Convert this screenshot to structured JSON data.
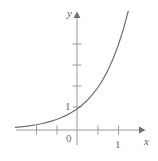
{
  "figure": {
    "kind": "cartesian-plot",
    "background_color": "#ffffff",
    "width": 158,
    "height": 161
  },
  "axes": {
    "x_axis": {
      "name": "x-axis",
      "label": "x",
      "arrow": true,
      "tick_labels": [
        "1"
      ],
      "origin_label": "0"
    },
    "y_axis": {
      "name": "y-axis",
      "label": "y",
      "arrow": true,
      "tick_labels": [
        "1"
      ]
    },
    "axis_color": "#9b9b9b",
    "tick_color": "#9b9b9b",
    "label_color": "#5d5d5d"
  },
  "chart_data": {
    "type": "line",
    "title": "",
    "subtitle": "",
    "xlabel": "x",
    "ylabel": "y",
    "xlim": [
      -3.0,
      3.1
    ],
    "ylim": [
      -0.35,
      5.7
    ],
    "grid": false,
    "legend": null,
    "x_ticks": [
      -2,
      -1,
      0,
      1,
      2
    ],
    "x_tick_labels": [
      "",
      "",
      "0",
      "1",
      ""
    ],
    "y_ticks": [
      1,
      2,
      3,
      4
    ],
    "y_tick_labels": [
      "1",
      "",
      "",
      ""
    ],
    "annotations": [],
    "series": [
      {
        "name": "exponential-curve",
        "color": "#6e6e6e",
        "linewidth": 1.2,
        "description": "increasing exponential through (0, 1)",
        "x": [
          -3.0,
          -2.75,
          -2.5,
          -2.25,
          -2.0,
          -1.75,
          -1.5,
          -1.25,
          -1.0,
          -0.75,
          -0.5,
          -0.25,
          0.0,
          0.25,
          0.5,
          0.75,
          1.0,
          1.25,
          1.5,
          1.75,
          2.0,
          2.25,
          2.5,
          2.6
        ],
        "y": [
          0.125,
          0.149,
          0.177,
          0.21,
          0.25,
          0.297,
          0.354,
          0.42,
          0.5,
          0.595,
          0.707,
          0.841,
          1.0,
          1.189,
          1.414,
          1.682,
          2.0,
          2.378,
          2.828,
          3.364,
          4.0,
          4.757,
          5.657,
          6.063
        ]
      }
    ]
  }
}
